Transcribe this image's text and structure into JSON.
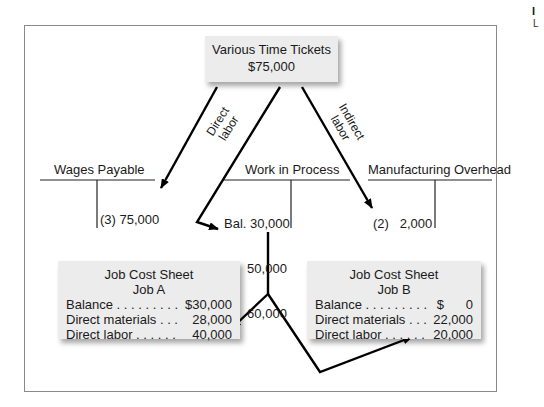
{
  "source_box": {
    "title": "Various Time Tickets",
    "amount": "$75,000"
  },
  "flow_labels": {
    "direct": [
      "Direct",
      "labor"
    ],
    "indirect": [
      "Indirect",
      "labor"
    ]
  },
  "accounts": {
    "wages_payable": {
      "title": "Wages Payable",
      "credit": [
        "(3) 75,000"
      ]
    },
    "work_in_process": {
      "title": "Work in Process",
      "debit": [
        "Bal. 30,000",
        "(2)  50,000",
        "(3)  60,000"
      ]
    },
    "manufacturing_overhead": {
      "title": "Manufacturing Overhead",
      "debit": [
        "(2)   2,000",
        "(3) 15,000"
      ]
    }
  },
  "job_cost_sheets": [
    {
      "title": "Job Cost Sheet",
      "job": "Job A",
      "rows": [
        {
          "label": "Balance . . . . . . . . .",
          "value": "$30,000"
        },
        {
          "label": "Direct materials . . .",
          "value": "28,000"
        },
        {
          "label": "Direct labor . . . . . .",
          "value": "40,000"
        }
      ]
    },
    {
      "title": "Job Cost Sheet",
      "job": "Job B",
      "rows": [
        {
          "label": "Balance . . . . . . . . .",
          "value": "$      0"
        },
        {
          "label": "Direct materials . . .",
          "value": "22,000"
        },
        {
          "label": "Direct labor . . . . . .",
          "value": "20,000"
        }
      ]
    }
  ],
  "edge_text": {
    "line1": "I",
    "line2": "L"
  },
  "colors": {
    "box_bg": "#ececec",
    "frame": "#8a8a8a",
    "arrow": "#000000"
  }
}
